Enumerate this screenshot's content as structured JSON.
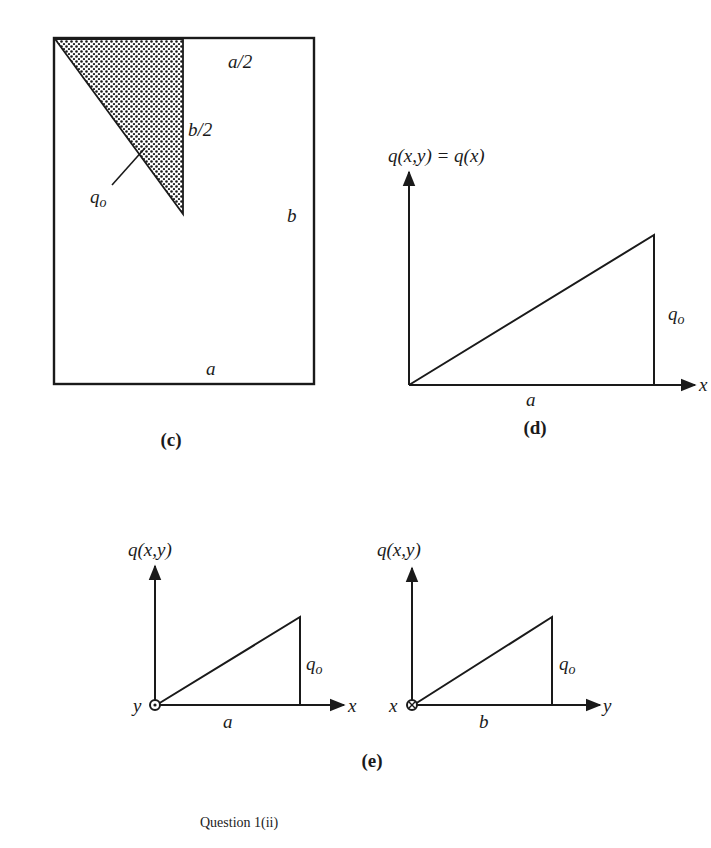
{
  "figure_c": {
    "caption": "(c)",
    "labels": {
      "top_half": "a/2",
      "side_half": "b/2",
      "load": "q",
      "load_sub": "o",
      "height": "b",
      "width": "a"
    }
  },
  "figure_d": {
    "caption": "(d)",
    "y_axis_label": "q(x,y) = q(x)",
    "x_axis_label": "x",
    "base_label": "a",
    "height_label": "q",
    "height_sub": "o"
  },
  "figure_e": {
    "caption": "(e)",
    "left": {
      "y_axis_label": "q(x,y)",
      "x_axis_label": "x",
      "out_of_plane_label": "y",
      "out_of_plane_symbol": "dot-circle",
      "base_label": "a",
      "height_label": "q",
      "height_sub": "o"
    },
    "right": {
      "y_axis_label": "q(x,y)",
      "x_axis_label": "y",
      "out_of_plane_label": "x",
      "out_of_plane_symbol": "cross-circle",
      "base_label": "b",
      "height_label": "q",
      "height_sub": "o"
    }
  },
  "footer": {
    "question_label": "Question 1(ii)"
  }
}
